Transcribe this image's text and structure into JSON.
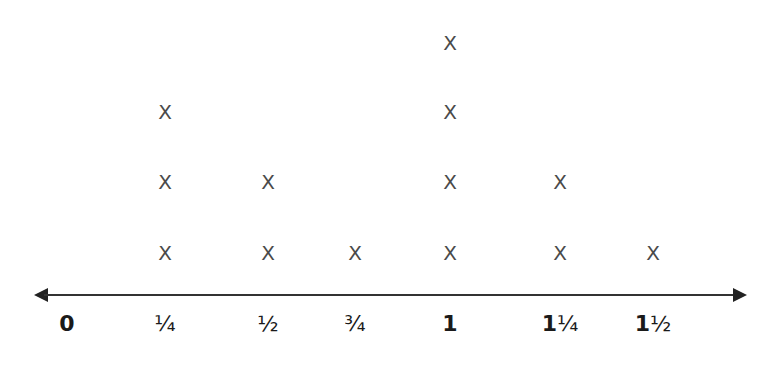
{
  "chart_data": {
    "type": "scatter",
    "subtype": "line-plot (dot plot with X marks)",
    "title": "",
    "xlabel": "",
    "ylabel": "",
    "marker": "X",
    "categories": [
      "0",
      "1/4",
      "1/2",
      "3/4",
      "1",
      "1 1/4",
      "1 1/2"
    ],
    "tick_labels": [
      "0",
      "¼",
      "½",
      "¾",
      "1",
      "1¼",
      "1½"
    ],
    "x": [
      0,
      0.25,
      0.5,
      0.75,
      1,
      1.25,
      1.5
    ],
    "values": [
      0,
      3,
      2,
      1,
      4,
      2,
      1
    ],
    "axis": {
      "arrows": "both",
      "grid": false
    },
    "legend": null
  },
  "layout": {
    "tick_px": [
      67,
      165,
      268,
      355,
      450,
      560,
      653
    ],
    "row_px": [
      253,
      182,
      112,
      43
    ]
  },
  "colors": {
    "marker": "#4a4a4a",
    "axis": "#333333",
    "label": "#1a1a1a"
  }
}
